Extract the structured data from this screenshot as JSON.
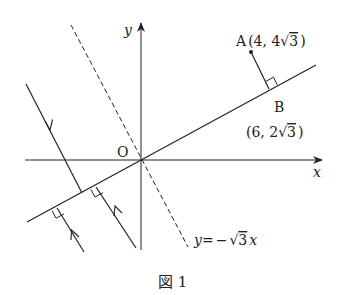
{
  "figure": {
    "caption": "図 1",
    "axes": {
      "x_label": "x",
      "y_label": "y",
      "origin_label": "O"
    },
    "points": [
      {
        "id": "A",
        "label": "A",
        "coords": "(4, 4√3)"
      },
      {
        "id": "B",
        "label": "B",
        "coords": "(6, 2√3)"
      }
    ],
    "lines": [
      {
        "id": "mirror",
        "style": "solid",
        "description": "line through O and B"
      },
      {
        "id": "dashed",
        "style": "dashed",
        "label": "y = −√3 x"
      }
    ],
    "rays": [
      {
        "id": "incident",
        "direction": "down"
      },
      {
        "id": "reflected-1",
        "direction": "up"
      },
      {
        "id": "reflected-2",
        "direction": "up"
      }
    ],
    "dashed_label": {
      "lhs": "y",
      "eq": "=",
      "minus": "−",
      "sqrt": "√",
      "radicand": "3",
      "var": "x"
    },
    "A_label": {
      "name": "A",
      "open": "(4, 4",
      "sqrt": "√",
      "radicand": "3",
      "close": ")"
    },
    "B_label": {
      "name": "B",
      "open": "(6, 2",
      "sqrt": "√",
      "radicand": "3",
      "close": ")"
    },
    "colors": {
      "stroke": "#222222",
      "background": "#ffffff"
    }
  }
}
